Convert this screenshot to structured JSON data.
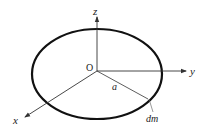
{
  "diagram": {
    "labels": {
      "z_axis": "z",
      "y_axis": "y",
      "x_axis": "x",
      "origin": "O",
      "radius": "a",
      "mass_element": "dm"
    },
    "colors": {
      "ring": "#111111",
      "axes": "#333333",
      "text": "#222222"
    }
  }
}
